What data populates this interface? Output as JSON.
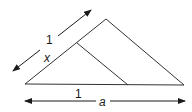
{
  "diagram": {
    "labels": {
      "top_arrow_length": "1",
      "side_segment": "x",
      "base_small": "1",
      "base_total": "a"
    },
    "colors": {
      "line": "#333333",
      "text": "#1a1a1a",
      "background": "#ffffff"
    }
  }
}
